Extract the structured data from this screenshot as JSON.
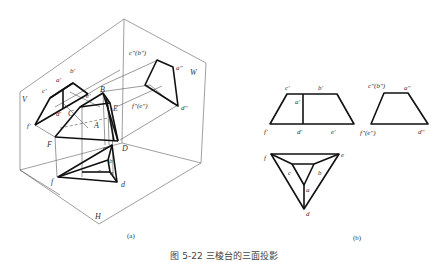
{
  "figure": {
    "caption": "图 5-22  三棱台的三面投影",
    "panel_a_label": "(a)",
    "panel_b_label": "(b)"
  },
  "panel_a": {
    "planes": {
      "V": "V",
      "H": "H",
      "W": "W"
    },
    "space_points": {
      "A": "A",
      "B": "B",
      "C": "C",
      "D": "D",
      "E": "E",
      "F": "F"
    },
    "front_projection": {
      "a": "a'",
      "b": "b'",
      "c": "c'",
      "d": "d'",
      "e": "e'",
      "f": "f'"
    },
    "top_projection": {
      "a": "a",
      "b": "b",
      "c": "c",
      "d": "d",
      "e": "e",
      "f": "f"
    },
    "side_projection": {
      "cb": "c\"(b\")",
      "a": "a\"",
      "fe": "f\"(e\")",
      "d": "d\""
    }
  },
  "panel_b": {
    "front_view": {
      "c": "c'",
      "b": "b'",
      "a": "a'",
      "f": "f'",
      "d": "d'",
      "e": "e'"
    },
    "side_view": {
      "cb": "c\"(b\")",
      "a": "a\"",
      "fe": "f\"(e\")",
      "d": "d\""
    },
    "top_view": {
      "f": "f",
      "e": "e",
      "c": "c",
      "b": "b",
      "a": "a",
      "d": "d"
    }
  }
}
